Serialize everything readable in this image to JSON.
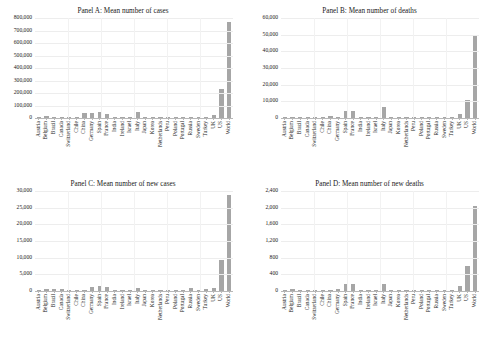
{
  "figure": {
    "background": "#ffffff",
    "bar_color": "#a6a6a6",
    "gridline_color": "#ededed",
    "axis_color": "#b8b8b8"
  },
  "categories": [
    "Austria",
    "Belgium",
    "Brazil",
    "Canada",
    "Switzerland",
    "Chile",
    "China",
    "Germany",
    "Spain",
    "France",
    "India",
    "Ireland",
    "Israel",
    "Italy",
    "Japan",
    "Korea",
    "Netherlands",
    "Peru",
    "Poland",
    "Portugal",
    "Russia",
    "Sweden",
    "Turkey",
    "UK",
    "US",
    "World"
  ],
  "chart_data": [
    {
      "type": "bar",
      "panel": "A",
      "title": "Panel A: Mean number of cases",
      "xlabel": "",
      "ylabel": "",
      "ylim": [
        0,
        800000
      ],
      "ytick_step": 100000,
      "ticks": [
        "0",
        "100,000",
        "200,000",
        "300,000",
        "400,000",
        "500,000",
        "600,000",
        "700,000",
        "800,000"
      ],
      "grid": true,
      "legend": "none",
      "categories": [
        "Austria",
        "Belgium",
        "Brazil",
        "Canada",
        "Switzerland",
        "Chile",
        "China",
        "Germany",
        "Spain",
        "France",
        "India",
        "Ireland",
        "Israel",
        "Italy",
        "Japan",
        "Korea",
        "Netherlands",
        "Peru",
        "Poland",
        "Portugal",
        "Russia",
        "Sweden",
        "Turkey",
        "UK",
        "US",
        "World"
      ],
      "values": [
        9000,
        14000,
        9000,
        11000,
        12000,
        6000,
        42000,
        38000,
        46000,
        34000,
        9000,
        6000,
        7000,
        52000,
        7000,
        6000,
        9000,
        6000,
        5000,
        6000,
        10000,
        9000,
        12000,
        26000,
        230000,
        765000
      ]
    },
    {
      "type": "bar",
      "panel": "B",
      "title": "Panel B: Mean number of deaths",
      "xlabel": "",
      "ylabel": "",
      "ylim": [
        0,
        60000
      ],
      "ytick_step": 10000,
      "ticks": [
        "0",
        "10,000",
        "20,000",
        "30,000",
        "40,000",
        "50,000",
        "60,000"
      ],
      "grid": true,
      "legend": "none",
      "categories": [
        "Austria",
        "Belgium",
        "Brazil",
        "Canada",
        "Switzerland",
        "Chile",
        "China",
        "Germany",
        "Spain",
        "France",
        "India",
        "Ireland",
        "Israel",
        "Italy",
        "Japan",
        "Korea",
        "Netherlands",
        "Peru",
        "Poland",
        "Portugal",
        "Russia",
        "Sweden",
        "Turkey",
        "UK",
        "US",
        "World"
      ],
      "values": [
        300,
        900,
        400,
        600,
        500,
        150,
        1500,
        700,
        4400,
        4200,
        300,
        200,
        100,
        6800,
        200,
        100,
        900,
        200,
        150,
        200,
        150,
        500,
        300,
        2700,
        11000,
        50000
      ]
    },
    {
      "type": "bar",
      "panel": "C",
      "title": "Panel C: Mean number of new cases",
      "xlabel": "",
      "ylabel": "",
      "ylim": [
        0,
        30000
      ],
      "ytick_step": 5000,
      "ticks": [
        "0",
        "5,000",
        "10,000",
        "15,000",
        "20,000",
        "25,000",
        "30,000"
      ],
      "grid": true,
      "legend": "none",
      "categories": [
        "Austria",
        "Belgium",
        "Brazil",
        "Canada",
        "Switzerland",
        "Chile",
        "China",
        "Germany",
        "Spain",
        "France",
        "India",
        "Ireland",
        "Israel",
        "Italy",
        "Japan",
        "Korea",
        "Netherlands",
        "Peru",
        "Poland",
        "Portugal",
        "Russia",
        "Sweden",
        "Turkey",
        "UK",
        "US",
        "World"
      ],
      "values": [
        350,
        600,
        700,
        600,
        450,
        300,
        450,
        1200,
        1500,
        1100,
        450,
        300,
        350,
        900,
        300,
        250,
        400,
        300,
        250,
        350,
        800,
        350,
        700,
        900,
        9200,
        28700
      ]
    },
    {
      "type": "bar",
      "panel": "D",
      "title": "Panel D: Mean number of new deaths",
      "xlabel": "",
      "ylabel": "",
      "ylim": [
        0,
        2400
      ],
      "ytick_step": 400,
      "ticks": [
        "0",
        "400",
        "800",
        "1,200",
        "1,600",
        "2,000",
        "2,400"
      ],
      "grid": true,
      "legend": "none",
      "categories": [
        "Austria",
        "Belgium",
        "Brazil",
        "Canada",
        "Switzerland",
        "Chile",
        "China",
        "Germany",
        "Spain",
        "France",
        "India",
        "Ireland",
        "Israel",
        "Italy",
        "Japan",
        "Korea",
        "Netherlands",
        "Peru",
        "Poland",
        "Portugal",
        "Russia",
        "Sweden",
        "Turkey",
        "UK",
        "US",
        "World"
      ],
      "values": [
        15,
        45,
        30,
        25,
        20,
        8,
        18,
        40,
        175,
        165,
        15,
        8,
        6,
        170,
        8,
        5,
        35,
        10,
        8,
        12,
        10,
        25,
        15,
        110,
        590,
        2050
      ]
    }
  ]
}
